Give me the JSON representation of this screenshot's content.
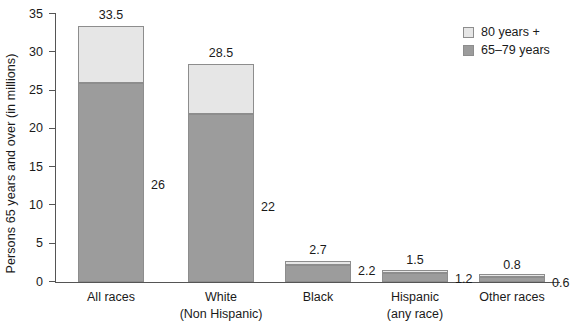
{
  "chart_data": {
    "type": "bar",
    "subtype": "stacked-vertical",
    "title": "",
    "xlabel": "",
    "ylabel": "Persons 65 years and over (in millions)",
    "ylim": [
      0,
      35
    ],
    "yticks": [
      0,
      5,
      10,
      15,
      20,
      25,
      30,
      35
    ],
    "ytick_labels": [
      "0",
      "5",
      "10",
      "15",
      "20",
      "25",
      "30",
      "35"
    ],
    "grid": false,
    "legend_position": "top-right",
    "categories": [
      "All races",
      "White\n(Non Hispanic)",
      "Black",
      "Hispanic\n(any race)",
      "Other races"
    ],
    "category_lines": [
      [
        "All races"
      ],
      [
        "White",
        "(Non Hispanic)"
      ],
      [
        "Black"
      ],
      [
        "Hispanic",
        "(any race)"
      ],
      [
        "Other races"
      ]
    ],
    "series": [
      {
        "name": "65–79 years",
        "color": "#9c9c9c",
        "values": [
          26,
          22,
          2.2,
          1.2,
          0.6
        ],
        "value_labels": [
          "26",
          "22",
          "2.2",
          "1.2",
          "0.6"
        ]
      },
      {
        "name": "80 years +",
        "color": "#e6e6e6",
        "values": [
          7.5,
          6.5,
          0.5,
          0.3,
          0.2
        ],
        "value_labels": [
          "",
          "",
          "",
          "",
          ""
        ]
      }
    ],
    "totals": [
      33.5,
      28.5,
      2.7,
      1.5,
      0.8
    ],
    "total_labels": [
      "33.5",
      "28.5",
      "2.7",
      "1.5",
      "0.8"
    ]
  },
  "legend": {
    "items": [
      {
        "label": "80 years +",
        "color": "#e6e6e6"
      },
      {
        "label": "65–79 years",
        "color": "#9c9c9c"
      }
    ]
  },
  "axis": {
    "y_title": "Persons 65 years and over (in millions)"
  },
  "colors": {
    "segment_low": "#9c9c9c",
    "segment_high": "#e6e6e6",
    "border": "#8d8d8d",
    "axis": "#555555",
    "text": "#1a1a1a",
    "background": "#ffffff"
  }
}
